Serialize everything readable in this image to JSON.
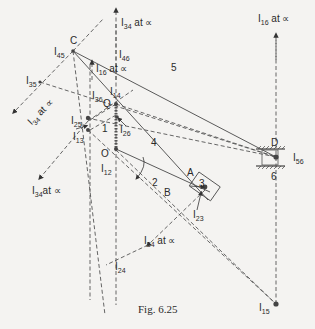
{
  "figure": {
    "caption": "Fig. 6.25",
    "points": {
      "C": "C",
      "D": "D",
      "Q": "Q",
      "O": "O",
      "A": "A",
      "B": "B"
    },
    "links": [
      "1",
      "2",
      "3",
      "4",
      "5",
      "6"
    ],
    "instant_centres": {
      "I45": {
        "main": "I",
        "sub": "45"
      },
      "I46": {
        "main": "I",
        "sub": "46"
      },
      "I35": {
        "main": "I",
        "sub": "35"
      },
      "I36": {
        "main": "I",
        "sub": "36"
      },
      "I14": {
        "main": "I",
        "sub": "14"
      },
      "I25": {
        "main": "I",
        "sub": "25"
      },
      "I13": {
        "main": "I",
        "sub": "13"
      },
      "I26": {
        "main": "I",
        "sub": "26"
      },
      "I12": {
        "main": "I",
        "sub": "12"
      },
      "I23": {
        "main": "I",
        "sub": "23"
      },
      "I24": {
        "main": "I",
        "sub": "24"
      },
      "I15": {
        "main": "I",
        "sub": "15"
      },
      "I56": {
        "main": "I",
        "sub": "56"
      }
    },
    "infinity_labels": {
      "I34_top": {
        "main": "I",
        "sub": "34",
        "suffix": " at ∝"
      },
      "I16_mid": {
        "main": "I",
        "sub": "16",
        "suffix": " at ∝"
      },
      "I16_right": {
        "main": "I",
        "sub": "16",
        "suffix": " at ∝"
      },
      "I34_left": {
        "main": "I",
        "sub": "34",
        "suffix": " at ∝"
      },
      "I34_lowleft": {
        "main": "I",
        "sub": "34",
        "suffix": "at ∝"
      },
      "I34_bottom": {
        "main": "I",
        "sub": "34",
        "suffix": " at ∝"
      }
    }
  }
}
